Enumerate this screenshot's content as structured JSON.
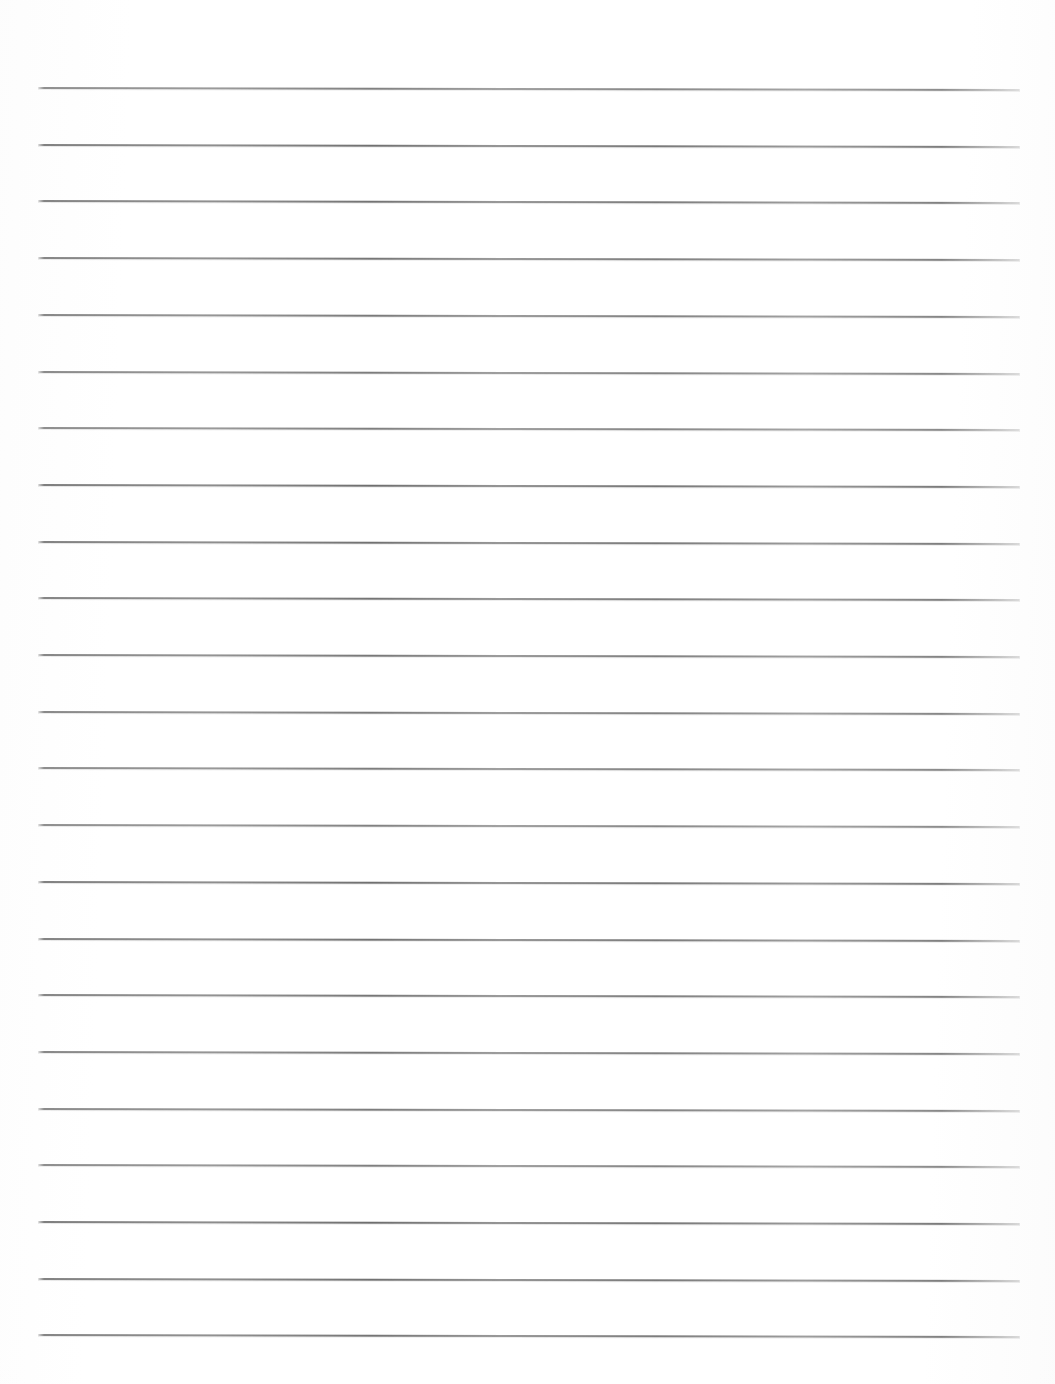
{
  "document": {
    "kind": "scanned-ruled-notebook-page",
    "title": "Blank Lined Paper",
    "page_width": 1055,
    "page_height": 1384,
    "background_color": "#ffffff",
    "content_text": "",
    "handwriting_present": "none",
    "printed_text_present": "none"
  },
  "ruling": {
    "line_color": "#787878",
    "line_thickness_px": 2,
    "line_count": 23,
    "first_line_y": 88,
    "line_spacing_px": 56.7,
    "left_margin_x": 38,
    "right_margin_x": 1020,
    "line_length_px": 982,
    "orientation": "horizontal",
    "tilt_px_over_width": 2,
    "lines_y": [
      88,
      144.7,
      201.4,
      258.1,
      314.8,
      371.5,
      428.2,
      484.9,
      541.6,
      598.3,
      655,
      711.7,
      768.4,
      825.1,
      881.8,
      938.5,
      995.2,
      1051.9,
      1108.6,
      1165.3,
      1222,
      1278.7,
      1335.4
    ]
  },
  "margins": {
    "top_blank_px": 88,
    "bottom_blank_px": 49,
    "left_blank_px": 38,
    "right_blank_px": 35,
    "vertical_margin_rule": "none"
  },
  "annotations": {
    "holes": "none",
    "header": "",
    "footer": "",
    "page_number": ""
  }
}
